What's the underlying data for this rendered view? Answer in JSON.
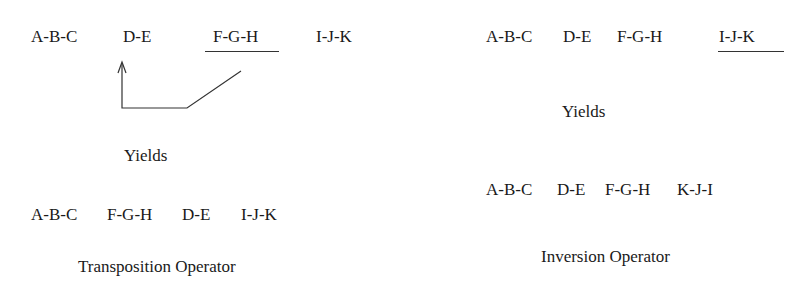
{
  "transposition": {
    "original": [
      "A-B-C",
      "D-E",
      "F-G-H",
      "I-J-K"
    ],
    "moved_segment": "F-G-H",
    "yields_label": "Yields",
    "result": [
      "A-B-C",
      "F-G-H",
      "D-E",
      "I-J-K"
    ],
    "caption": "Transposition Operator"
  },
  "inversion": {
    "original": [
      "A-B-C",
      "D-E",
      "F-G-H",
      "I-J-K"
    ],
    "inverted_segment": "I-J-K",
    "yields_label": "Yields",
    "result": [
      "A-B-C",
      "D-E",
      "F-G-H",
      "K-J-I"
    ],
    "caption": "Inversion Operator"
  }
}
